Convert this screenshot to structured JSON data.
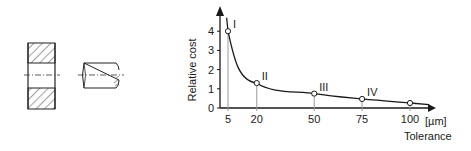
{
  "figure": {
    "left_drawing": {
      "parts": [
        "bore-section",
        "pin"
      ]
    }
  },
  "chart_data": {
    "type": "line",
    "title": "",
    "xlabel": "Tolerance",
    "xunit": "[µm]",
    "ylabel": "Relative cost",
    "xlim": [
      0,
      110
    ],
    "ylim": [
      0,
      4.6
    ],
    "xticks": [
      5,
      20,
      50,
      75,
      100
    ],
    "xtick_labels": [
      "5",
      "20",
      "50",
      "75",
      "100"
    ],
    "yticks": [
      0,
      1,
      2,
      3,
      4
    ],
    "ytick_labels": [
      "0",
      "1",
      "2",
      "3",
      "4"
    ],
    "grid": false,
    "series": [
      {
        "name": "Relative cost",
        "x": [
          5,
          20,
          50,
          75,
          100
        ],
        "y": [
          4.0,
          1.3,
          0.75,
          0.47,
          0.26
        ],
        "point_labels": [
          "I",
          "II",
          "III",
          "IV",
          ""
        ]
      }
    ],
    "colors": {
      "line": "#1a1a1a",
      "drop_line": "#9a9a9a"
    }
  }
}
